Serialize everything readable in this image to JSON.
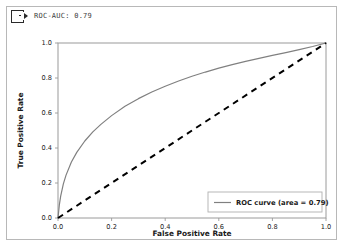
{
  "window": {
    "header": {
      "icon": "export-icon",
      "title": "ROC-AUC: 0.79"
    }
  },
  "chart_data": {
    "type": "line",
    "title": "",
    "xlabel": "False Positive Rate",
    "ylabel": "True Positive Rate",
    "xlim": [
      0.0,
      1.0
    ],
    "ylim": [
      0.0,
      1.0
    ],
    "grid": false,
    "legend_position": "lower right",
    "xticks": [
      "0.0",
      "0.2",
      "0.4",
      "0.6",
      "0.8",
      "1.0"
    ],
    "xtick_values": [
      0.0,
      0.2,
      0.4,
      0.6,
      0.8,
      1.0
    ],
    "yticks": [
      "0.0",
      "0.2",
      "0.4",
      "0.6",
      "0.8",
      "1.0"
    ],
    "ytick_values": [
      0.0,
      0.2,
      0.4,
      0.6,
      0.8,
      1.0
    ],
    "auc": 0.79,
    "series": [
      {
        "name": "ROC curve (area = 0.79)",
        "color": "#808080",
        "style": "solid",
        "x": [
          0.0,
          0.005,
          0.01,
          0.02,
          0.03,
          0.05,
          0.07,
          0.1,
          0.13,
          0.16,
          0.2,
          0.25,
          0.3,
          0.35,
          0.4,
          0.45,
          0.5,
          0.55,
          0.6,
          0.65,
          0.7,
          0.75,
          0.8,
          0.85,
          0.9,
          0.95,
          1.0
        ],
        "y": [
          0.0,
          0.075,
          0.125,
          0.195,
          0.245,
          0.32,
          0.375,
          0.44,
          0.492,
          0.535,
          0.585,
          0.638,
          0.682,
          0.72,
          0.753,
          0.783,
          0.81,
          0.834,
          0.856,
          0.876,
          0.895,
          0.912,
          0.929,
          0.945,
          0.962,
          0.98,
          1.0
        ]
      },
      {
        "name": "chance-diagonal",
        "color": "#000000",
        "style": "dashed",
        "x": [
          0.0,
          1.0
        ],
        "y": [
          0.0,
          1.0
        ]
      }
    ],
    "legend": [
      {
        "label": "ROC curve (area = 0.79)",
        "color": "#808080",
        "style": "solid"
      }
    ]
  }
}
